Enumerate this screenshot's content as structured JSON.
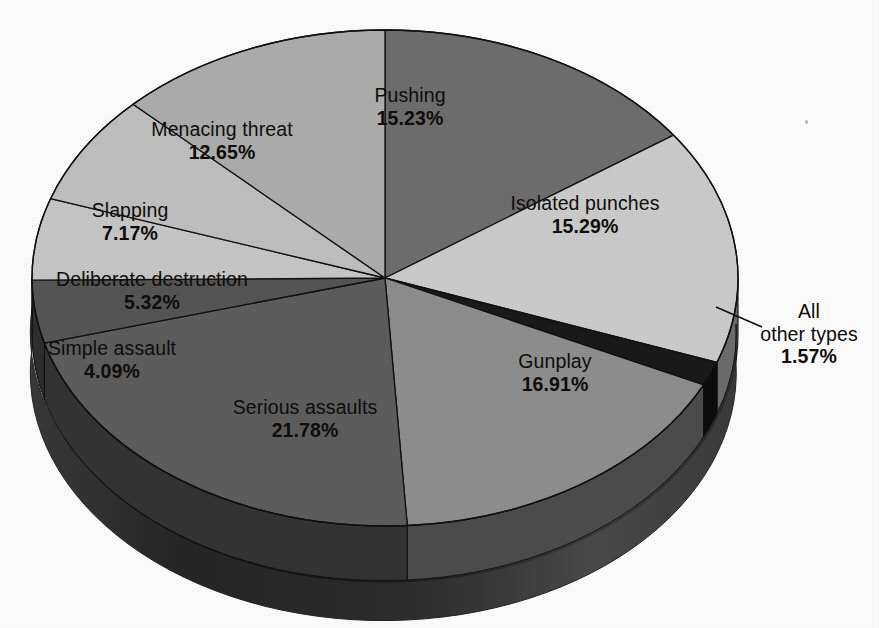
{
  "chart_data": {
    "type": "pie",
    "title": "",
    "subtitle": "",
    "xlabel": "",
    "ylabel": "",
    "legend_position": "none",
    "grid": false,
    "value_unit": "%",
    "value_suffix": "%",
    "style": "3d-exploded-none",
    "rotation_start_deg": 0,
    "direction": "clockwise",
    "categories": [
      "Pushing",
      "Isolated punches",
      "All other types",
      "Gunplay",
      "Serious assaults",
      "Simple assault",
      "Deliberate destruction",
      "Slapping",
      "Menacing threat"
    ],
    "values": [
      15.23,
      15.29,
      1.57,
      16.91,
      21.78,
      4.09,
      5.32,
      7.17,
      12.65
    ],
    "value_labels": [
      "15.23%",
      "15.29%",
      "1.57%",
      "16.91%",
      "21.78%",
      "4.09%",
      "5.32%",
      "7.17%",
      "12.65%"
    ],
    "total": 100.01,
    "slice_colors": [
      "#6f6f6f",
      "#cdcdcd",
      "#1a1a1a",
      "#8f8f8f",
      "#5e5e5e",
      "#565656",
      "#c8c8c8",
      "#c1c1c1",
      "#aeaeae"
    ],
    "slices": [
      {
        "label": "Pushing",
        "value": 15.23,
        "value_label": "15.23%",
        "color": "#6f6f6f",
        "side_color": "#3b3b3b"
      },
      {
        "label": "Isolated punches",
        "value": 15.29,
        "value_label": "15.29%",
        "color": "#cdcdcd",
        "side_color": "#6e6e6e"
      },
      {
        "label": "All other types",
        "value": 1.57,
        "value_label": "1.57%",
        "color": "#1a1a1a",
        "side_color": "#0d0d0d",
        "callout": true
      },
      {
        "label": "Gunplay",
        "value": 16.91,
        "value_label": "16.91%",
        "color": "#8f8f8f",
        "side_color": "#4d4d4d"
      },
      {
        "label": "Serious assaults",
        "value": 21.78,
        "value_label": "21.78%",
        "color": "#5e5e5e",
        "side_color": "#343434"
      },
      {
        "label": "Simple assault",
        "value": 4.09,
        "value_label": "4.09%",
        "color": "#565656",
        "side_color": "#2f2f2f"
      },
      {
        "label": "Deliberate destruction",
        "value": 5.32,
        "value_label": "5.32%",
        "color": "#c8c8c8",
        "side_color": "#6a6a6a"
      },
      {
        "label": "Slapping",
        "value": 7.17,
        "value_label": "7.17%",
        "color": "#c1c1c1",
        "side_color": "#666666"
      },
      {
        "label": "Menacing threat",
        "value": 12.65,
        "value_label": "12.65%",
        "color": "#aeaeae",
        "side_color": "#5c5c5c"
      }
    ]
  },
  "labels": {
    "pushing": {
      "name": "Pushing",
      "value": "15.23%"
    },
    "isolated": {
      "name": "Isolated punches",
      "value": "15.29%"
    },
    "other": {
      "name_line1": "All",
      "name_line2": "other types",
      "value": "1.57%"
    },
    "gunplay": {
      "name": "Gunplay",
      "value": "16.91%"
    },
    "serious": {
      "name": "Serious assaults",
      "value": "21.78%"
    },
    "simple": {
      "name": "Simple assault",
      "value": "4.09%"
    },
    "deliberate": {
      "name": "Deliberate destruction",
      "value": "5.32%"
    },
    "slapping": {
      "name": "Slapping",
      "value": "7.17%"
    },
    "menacing": {
      "name": "Menacing threat",
      "value": "12.65%"
    }
  },
  "geometry": {
    "center_x": 385,
    "center_y": 278,
    "radius_x": 353,
    "radius_y": 248,
    "depth": 56
  },
  "colors": {
    "background": "#ffffff",
    "text": "#100d0a",
    "outline": "#111111",
    "base_dark": "#171717"
  }
}
